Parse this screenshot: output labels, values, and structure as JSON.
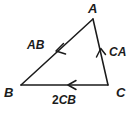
{
  "figure": {
    "background_color": "#ffffff",
    "ink_color": "#1b1b1b",
    "vertices": [
      {
        "name": "A",
        "label": "A",
        "x": 93,
        "y": 19,
        "label_x": 88,
        "label_y": 13
      },
      {
        "name": "B",
        "label": "B",
        "x": 21,
        "y": 85,
        "label_x": 4,
        "label_y": 97
      },
      {
        "name": "C",
        "label": "C",
        "x": 108,
        "y": 85,
        "label_x": 116,
        "label_y": 97
      }
    ],
    "edges": [
      {
        "name": "edge-ab",
        "from": "A",
        "to": "B",
        "label": "AB",
        "scalar": "",
        "label_x": 27,
        "label_y": 49,
        "arrow_x": 57,
        "arrow_y": 51,
        "direction": "A to B"
      },
      {
        "name": "edge-ca",
        "from": "C",
        "to": "A",
        "label": "CA",
        "scalar": "",
        "label_x": 109,
        "label_y": 56,
        "arrow_x": 101,
        "arrow_y": 51,
        "direction": "C to A"
      },
      {
        "name": "edge-cb",
        "from": "C",
        "to": "B",
        "label": "CB",
        "scalar": "2",
        "label_x": 52,
        "label_y": 104,
        "arrow_x": 69,
        "arrow_y": 85,
        "direction": "C to B"
      }
    ]
  }
}
